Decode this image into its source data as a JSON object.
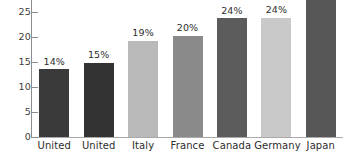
{
  "chart_data": {
    "type": "bar",
    "title": "",
    "subtitle": "",
    "xlabel": "",
    "ylabel": "",
    "ylim": [
      0,
      27.5
    ],
    "grid": false,
    "legend": null,
    "y_ticks": [
      0,
      5,
      10,
      15,
      20,
      25
    ],
    "y_tick_labels": [
      "0",
      "5",
      "10",
      "15",
      "20",
      "25"
    ],
    "categories": [
      "United",
      "United",
      "Italy",
      "France",
      "Canada",
      "Germany",
      "Japan"
    ],
    "values": [
      13.6,
      14.9,
      19.3,
      20.3,
      23.8,
      23.9,
      27.5
    ],
    "data_labels": [
      "14%",
      "15%",
      "19%",
      "20%",
      "24%",
      "24%",
      ""
    ],
    "bar_colors": [
      "#3a3a3a",
      "#333333",
      "#b9b9b9",
      "#8a8a8a",
      "#5c5c5c",
      "#c9c9c9",
      "#575757"
    ],
    "axis_color": "#8d8d8d",
    "baseline_color": "#a9a9a9",
    "text_color": "#2d2d2d",
    "background": "#ffffff"
  }
}
